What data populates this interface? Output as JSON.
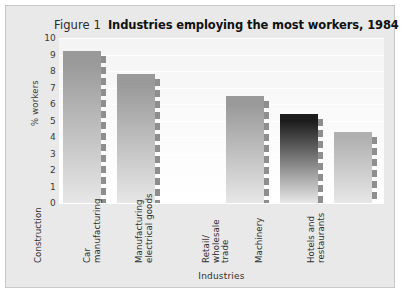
{
  "figure": {
    "number_label": "Figure 1",
    "title": "Industries employing the most workers, 1984"
  },
  "chart_data": {
    "type": "bar",
    "title": "Industries employing the most workers, 1984",
    "xlabel": "Industries",
    "ylabel": "% workers",
    "ylim": [
      0,
      10
    ],
    "ytick_labels": [
      "10",
      "9",
      "8",
      "7",
      "6",
      "5",
      "4",
      "3",
      "2",
      "1",
      "0"
    ],
    "ytick_values": [
      10,
      9,
      8,
      7,
      6,
      5,
      4,
      3,
      2,
      1,
      0
    ],
    "grid": true,
    "legend": "none",
    "categories": [
      "Construction",
      "Car\nmanufacturing",
      "Manufacturing\nelectrical goods",
      "Retail/\nwholesale\ntrade",
      "Machinery",
      "Hotels and\nrestaurants"
    ],
    "values": [
      9.2,
      7.8,
      0,
      6.5,
      5.4,
      4.3
    ],
    "bar_colors": [
      "#9a9a9a",
      "#9a9a9a",
      "#9a9a9a",
      "#9a9a9a",
      "#1c1c1c",
      "#b0b0b0"
    ]
  }
}
